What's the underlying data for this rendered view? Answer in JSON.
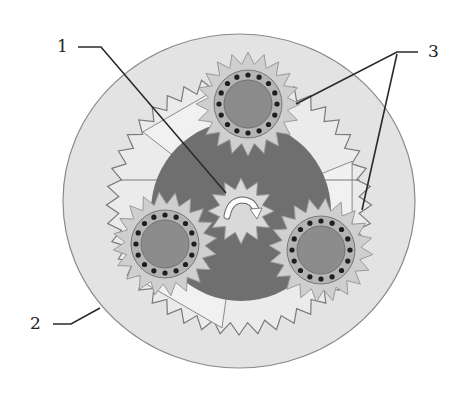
{
  "diagram": {
    "type": "planetary-gear-set",
    "labels": [
      {
        "id": "1",
        "text": "1",
        "refers_to": "sun-gear"
      },
      {
        "id": "2",
        "text": "2",
        "refers_to": "ring-gear"
      },
      {
        "id": "3",
        "text": "3",
        "refers_to": "planet-gears"
      }
    ],
    "components": {
      "ring_gear": {
        "label": "2",
        "teeth": 44
      },
      "sun_gear": {
        "label": "1",
        "teeth": 12,
        "rotation_arrow": "clockwise"
      },
      "planet_gears": {
        "label": "3",
        "count": 3,
        "teeth": 20,
        "bolt_holes": 16
      },
      "carrier": {
        "arms": 3
      }
    },
    "colors": {
      "background": "#ffffff",
      "ring_disk": "#e3e3e3",
      "ring_outline": "#8a8a8a",
      "carrier": "#6f6f6f",
      "planet_fill": "#cfcfcf",
      "planet_hub": "#8c8c8c",
      "planet_hub_ring": "#b4b4b4",
      "bolt": "#1e1e1e",
      "sun_fill": "#d9d9d9",
      "arrow": "#ffffff",
      "leader_line": "#2a2a2a",
      "light_sector": "#f1f1f1"
    }
  }
}
